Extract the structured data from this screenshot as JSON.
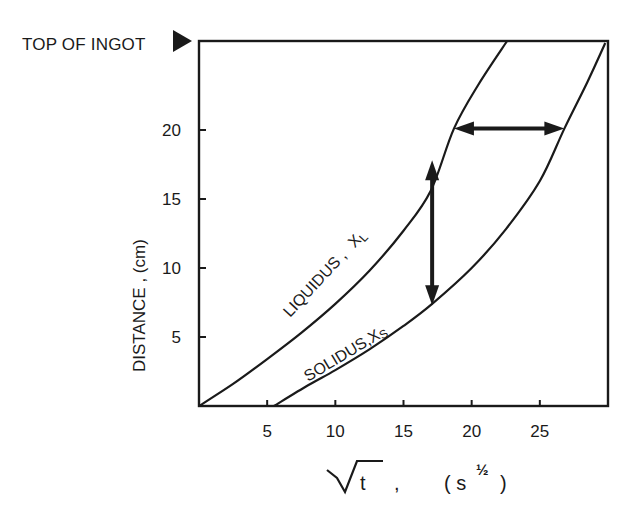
{
  "chart_data": {
    "type": "line",
    "title": "",
    "annotation_top": "TOP OF INGOT",
    "xlabel": "√t ,  ( s½ )",
    "xlabel_parts": {
      "var": "t",
      "comma": ",",
      "unit_open": "( s",
      "unit_exp": "½",
      "unit_close": ")"
    },
    "ylabel": "DISTANCE , (cm)",
    "xlim": [
      0,
      30
    ],
    "ylim": [
      0,
      26.5
    ],
    "xticks": [
      5,
      10,
      15,
      20,
      25
    ],
    "yticks": [
      5,
      10,
      15,
      20
    ],
    "xtick_labels": [
      "5",
      "10",
      "15",
      "20",
      "25"
    ],
    "ytick_labels": [
      "5",
      "10",
      "15",
      "20"
    ],
    "grid": false,
    "legend": null,
    "series": [
      {
        "name": "LIQUIDUS, XL",
        "label_main": "LIQUIDUS ,",
        "label_var": "X",
        "label_sub": "L",
        "x": [
          0,
          2.5,
          5,
          7.5,
          10,
          12.5,
          15,
          17,
          18.7,
          20.5,
          22.6
        ],
        "y": [
          0,
          1.6,
          3.4,
          5.3,
          7.4,
          9.8,
          12.7,
          15.6,
          20.1,
          23.3,
          26.5
        ]
      },
      {
        "name": "SOLIDUS, XS",
        "label_main": "SOLIDUS,",
        "label_var": "X",
        "label_sub": "S",
        "x": [
          5.5,
          8,
          10,
          12.5,
          15,
          17.1,
          20,
          22.5,
          25,
          26.8,
          28.5,
          29.8
        ],
        "y": [
          0,
          1.5,
          2.6,
          4.1,
          5.8,
          7.4,
          10.0,
          12.8,
          16.3,
          20.1,
          23.5,
          26.3
        ]
      }
    ],
    "annotations": [
      {
        "type": "double-arrow",
        "orientation": "vertical",
        "x": 17.1,
        "y_from": 7.3,
        "y_to": 17.8,
        "meaning": "distance gap at fixed time"
      },
      {
        "type": "double-arrow",
        "orientation": "horizontal",
        "y": 20.1,
        "x_from": 18.7,
        "x_to": 26.8,
        "meaning": "time gap at fixed distance"
      }
    ]
  },
  "colors": {
    "ink": "#1a1a1a",
    "background": "#ffffff"
  }
}
